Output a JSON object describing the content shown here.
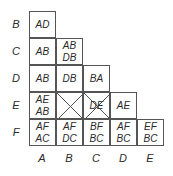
{
  "diagram": {
    "row_labels": [
      "B",
      "C",
      "D",
      "E",
      "F"
    ],
    "col_labels": [
      "A",
      "B",
      "C",
      "D",
      "E"
    ],
    "cells": {
      "B_A": [
        "AD"
      ],
      "C_A": [
        "AB"
      ],
      "C_B": [
        "AB",
        "DB"
      ],
      "D_A": [
        "AB"
      ],
      "D_B": [
        "DB"
      ],
      "D_C": [
        "BA"
      ],
      "E_A": [
        "AE",
        "AB"
      ],
      "E_B": [],
      "E_C": [
        "DE"
      ],
      "E_D": [
        "AE"
      ],
      "F_A": [
        "AF",
        "AC"
      ],
      "F_B": [
        "AF",
        "DC"
      ],
      "F_C": [
        "BF",
        "BC"
      ],
      "F_D": [
        "AF",
        "BC"
      ],
      "F_E": [
        "EF",
        "BC"
      ]
    },
    "crossed_cells": [
      "E_B",
      "E_C"
    ]
  }
}
